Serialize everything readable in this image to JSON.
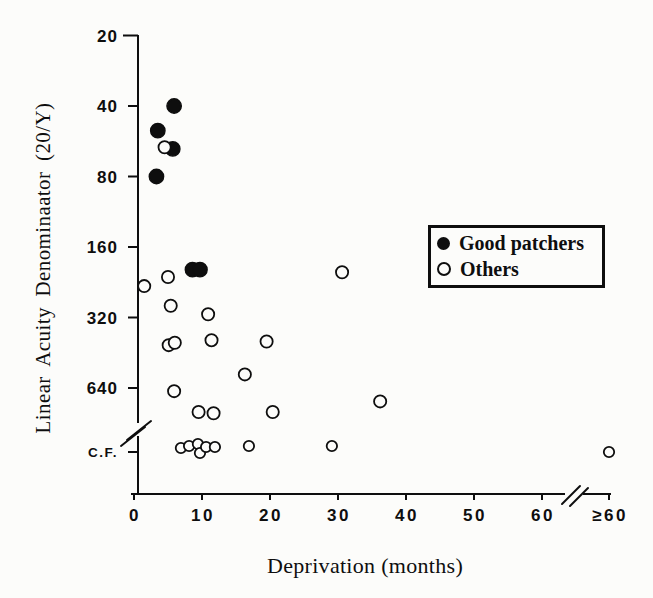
{
  "figure": {
    "background": "#fcfcfa",
    "ink": "#0e0e0e"
  },
  "legend": {
    "items": [
      {
        "label": "Good patchers",
        "marker": "filled-circle"
      },
      {
        "label": "Others",
        "marker": "open-circle"
      }
    ]
  },
  "chart_data": {
    "type": "scatter",
    "title": "",
    "xlabel": "Deprivation (months)",
    "ylabel": "Linear Acuity Denominaator (20/Y)",
    "x_ticks": [
      "0",
      "10",
      "20",
      "30",
      "40",
      "50",
      "60",
      "≥60"
    ],
    "y_ticks": [
      "20",
      "40",
      "80",
      "160",
      "320",
      "640",
      "C.F."
    ],
    "x_axis_break": "between 60 and ≥60",
    "y_axis_break": "between 640 and C.F. (counting fingers)",
    "y_scale": "log2 (acuity denominator doubles per tick, increasing downward)",
    "x_range_months": [
      0,
      60
    ],
    "legend_position": "upper right",
    "grid": false,
    "series": [
      {
        "name": "Good patchers",
        "marker": "filled",
        "points": [
          {
            "x": 5.9,
            "y": 40
          },
          {
            "x": 3.5,
            "y": 51
          },
          {
            "x": 5.7,
            "y": 61
          },
          {
            "x": 3.3,
            "y": 80
          },
          {
            "x": 8.6,
            "y": 200
          },
          {
            "x": 9.7,
            "y": 200
          }
        ]
      },
      {
        "name": "Others",
        "marker": "open",
        "points": [
          {
            "x": 4.5,
            "y": 60
          },
          {
            "x": 1.5,
            "y": 235
          },
          {
            "x": 5.0,
            "y": 215
          },
          {
            "x": 30.6,
            "y": 205
          },
          {
            "x": 5.4,
            "y": 285
          },
          {
            "x": 10.9,
            "y": 310
          },
          {
            "x": 5.1,
            "y": 420
          },
          {
            "x": 6.0,
            "y": 410
          },
          {
            "x": 11.4,
            "y": 400
          },
          {
            "x": 19.5,
            "y": 405
          },
          {
            "x": 16.3,
            "y": 560
          },
          {
            "x": 5.9,
            "y": 660
          },
          {
            "x": 9.5,
            "y": 810
          },
          {
            "x": 11.7,
            "y": 820
          },
          {
            "x": 20.4,
            "y": 810
          },
          {
            "x": 36.2,
            "y": 730
          },
          {
            "x": 6.9,
            "y": "CF",
            "dy": 0
          },
          {
            "x": 8.1,
            "y": "CF",
            "dy": -2
          },
          {
            "x": 9.4,
            "y": "CF",
            "dy": -4
          },
          {
            "x": 9.7,
            "y": "CF",
            "dy": 5
          },
          {
            "x": 10.6,
            "y": "CF",
            "dy": -1
          },
          {
            "x": 11.9,
            "y": "CF",
            "dy": -1
          },
          {
            "x": 16.9,
            "y": "CF",
            "dy": -2
          },
          {
            "x": 29.1,
            "y": "CF",
            "dy": -2
          },
          {
            "x": ">60",
            "y": "CF",
            "dy": 4
          }
        ]
      }
    ]
  }
}
